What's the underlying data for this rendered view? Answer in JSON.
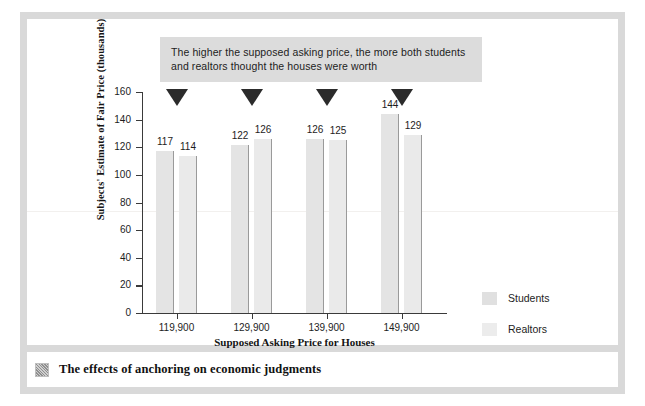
{
  "figure": {
    "caption": "The effects of anchoring on economic judgments",
    "caption_icon": "thumbnail-image-icon"
  },
  "annotation": {
    "line1": "The higher the supposed asking price, the more both students",
    "line2": "and realtors thought the houses were worth",
    "marker_icon": "down-triangle-icon",
    "background_color": "#dcdcdc"
  },
  "legend": {
    "items": [
      {
        "label": "Students",
        "color": "#e0e0e0"
      },
      {
        "label": "Realtors",
        "color": "#ececec"
      }
    ]
  },
  "chart_data": {
    "type": "bar",
    "title": "",
    "xlabel": "Supposed Asking Price for Houses",
    "ylabel": "Subjects' Estimate of Fair Price (thousands)",
    "categories": [
      "119,900",
      "129,900",
      "139,900",
      "149,900"
    ],
    "series": [
      {
        "name": "Students",
        "values": [
          117,
          122,
          126,
          144
        ],
        "color": "#e4e4e4"
      },
      {
        "name": "Realtors",
        "values": [
          114,
          126,
          125,
          129
        ],
        "color": "#eaeaea"
      }
    ],
    "ylim": [
      0,
      160
    ],
    "ytick_labels": [
      "0",
      "20",
      "40",
      "60",
      "80",
      "100",
      "120",
      "140",
      "160"
    ],
    "ytick_values": [
      0,
      20,
      40,
      60,
      80,
      100,
      120,
      140,
      160
    ],
    "grid": false,
    "legend_position": "right",
    "data_labels": true
  }
}
